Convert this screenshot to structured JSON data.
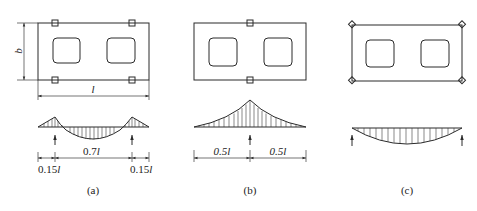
{
  "figure": {
    "panels": [
      {
        "id": "a",
        "caption": "(a)",
        "support_type": "square-supports",
        "support_positions": "0.15l from each end",
        "dimension_labels": {
          "width": "b",
          "length": "l",
          "left_overhang": "0.15l",
          "span": "0.7l",
          "right_overhang": "0.15l"
        },
        "moment_diagram": "hogging over supports, sagging in middle span"
      },
      {
        "id": "b",
        "caption": "(b)",
        "support_type": "square-supports",
        "support_positions": "mid-length",
        "dimension_labels": {
          "left_half": "0.5l",
          "right_half": "0.5l"
        },
        "moment_diagram": "hogging peak at center"
      },
      {
        "id": "c",
        "caption": "(c)",
        "support_type": "diamond-supports",
        "support_positions": "corners",
        "moment_diagram": "sagging parabola between end supports"
      }
    ],
    "labels": {
      "b": "b",
      "l": "l",
      "a_left": "0.15",
      "a_mid": "0.7",
      "a_right": "0.15",
      "b_left": "0.5",
      "b_right": "0.5",
      "l_sym": "l",
      "cap_a": "(a)",
      "cap_b": "(b)",
      "cap_c": "(c)"
    },
    "colors": {
      "line": "#2a2a2a",
      "background": "#ffffff"
    }
  }
}
